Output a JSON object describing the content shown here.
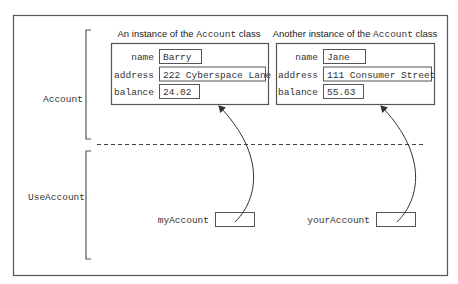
{
  "colors": {
    "line": "#555555",
    "text": "#333333",
    "background": "#ffffff"
  },
  "sections": {
    "top_label": "Account",
    "bottom_label": "UseAccount"
  },
  "instances": [
    {
      "caption_prefix": "An instance of the ",
      "caption_class": "Account",
      "caption_suffix": " class",
      "fields": [
        {
          "label": "name",
          "value": "Barry"
        },
        {
          "label": "address",
          "value": "222 Cyberspace Lane"
        },
        {
          "label": "balance",
          "value": "24.02"
        }
      ]
    },
    {
      "caption_prefix": "Another instance of the ",
      "caption_class": "Account",
      "caption_suffix": " class",
      "fields": [
        {
          "label": "name",
          "value": "Jane"
        },
        {
          "label": "address",
          "value": "111 Consumer Street"
        },
        {
          "label": "balance",
          "value": "55.63"
        }
      ]
    }
  ],
  "references": [
    {
      "label": "myAccount",
      "points_to": 0
    },
    {
      "label": "yourAccount",
      "points_to": 1
    }
  ]
}
